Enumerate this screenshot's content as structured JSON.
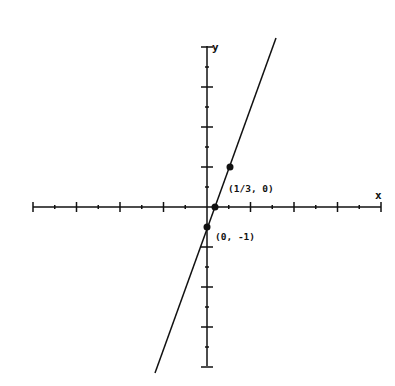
{
  "chart_data": {
    "type": "line",
    "title": "",
    "xlabel": "x",
    "ylabel": "y",
    "xlim": [
      -8,
      8
    ],
    "ylim": [
      -8,
      8
    ],
    "grid": false,
    "series": [
      {
        "name": "y = 3x - 1",
        "x": [
          -2.45,
          3.13
        ],
        "y": [
          -8.35,
          8.4
        ]
      }
    ],
    "points": [
      {
        "x": 0.3333,
        "y": 0,
        "label": "(1/3, 0)"
      },
      {
        "x": 0,
        "y": -1,
        "label": "(0, -1)"
      },
      {
        "x": 1,
        "y": 2,
        "label": ""
      }
    ],
    "annotations": [
      "(1/3, 0)",
      "(0, -1)"
    ]
  },
  "labels": {
    "x_axis": "x",
    "y_axis": "y",
    "point_a": "(1/3, 0)",
    "point_b": "(0, -1)"
  },
  "colors": {
    "ink": "#111111",
    "background": "#ffffff"
  }
}
